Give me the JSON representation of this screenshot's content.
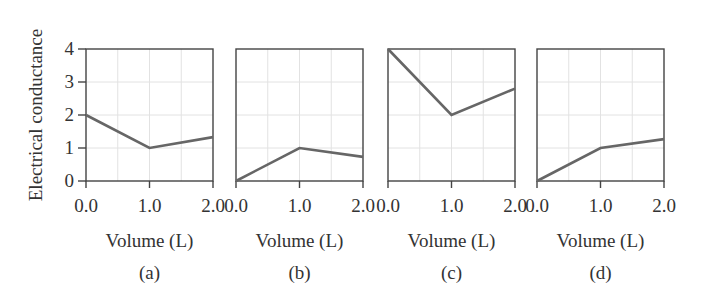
{
  "figure": {
    "ylabel": "Electrical conductance",
    "xlabel": "Volume (L)",
    "panel_labels": [
      "(a)",
      "(b)",
      "(c)",
      "(d)"
    ],
    "x_ticks": [
      "0.0",
      "1.0",
      "2.0"
    ],
    "y_ticks": [
      "0",
      "1",
      "2",
      "3",
      "4"
    ],
    "colors": {
      "line": "#666666",
      "axis": "#444444",
      "grid": "#e2e2e2",
      "text": "#333333"
    }
  },
  "chart_data": [
    {
      "type": "line",
      "title": "(a)",
      "xlabel": "Volume (L)",
      "ylabel": "Electrical conductance",
      "x": [
        0.0,
        1.0,
        2.0
      ],
      "values": [
        2.0,
        1.0,
        1.33
      ],
      "xlim": [
        0.0,
        2.0
      ],
      "ylim": [
        0,
        4
      ],
      "x_ticks": [
        "0.0",
        "1.0",
        "2.0"
      ],
      "y_ticks": [
        "0",
        "1",
        "2",
        "3",
        "4"
      ],
      "grid": true
    },
    {
      "type": "line",
      "title": "(b)",
      "xlabel": "Volume (L)",
      "ylabel": "",
      "x": [
        0.0,
        1.0,
        2.0
      ],
      "values": [
        0.0,
        1.0,
        0.73
      ],
      "xlim": [
        0.0,
        2.0
      ],
      "ylim": [
        0,
        4
      ],
      "x_ticks": [
        "0.0",
        "1.0",
        "2.0"
      ],
      "grid": true
    },
    {
      "type": "line",
      "title": "(c)",
      "xlabel": "Volume (L)",
      "ylabel": "",
      "x": [
        0.0,
        1.0,
        2.0
      ],
      "values": [
        4.0,
        2.0,
        2.8
      ],
      "xlim": [
        0.0,
        2.0
      ],
      "ylim": [
        0,
        4
      ],
      "x_ticks": [
        "0.0",
        "1.0",
        "2.0"
      ],
      "grid": true
    },
    {
      "type": "line",
      "title": "(d)",
      "xlabel": "Volume (L)",
      "ylabel": "",
      "x": [
        0.0,
        1.0,
        2.0
      ],
      "values": [
        0.0,
        1.0,
        1.27
      ],
      "xlim": [
        0.0,
        2.0
      ],
      "ylim": [
        0,
        4
      ],
      "x_ticks": [
        "0.0",
        "1.0",
        "2.0"
      ],
      "grid": true
    }
  ]
}
